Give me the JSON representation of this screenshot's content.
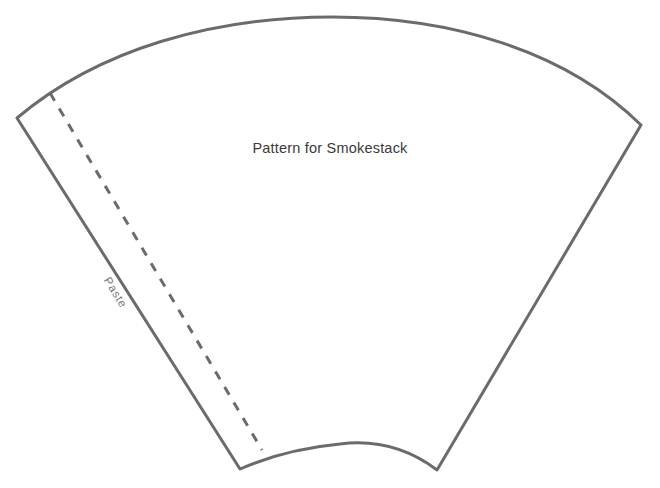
{
  "document": {
    "title": "Pattern for Smokestack",
    "background_color": "#ffffff",
    "width": 660,
    "height": 488
  },
  "labels": {
    "main": "Pattern for Smokestack",
    "paste_tab": "Paste"
  },
  "style": {
    "outline_color": "#6b6b6b",
    "outline_width": "3",
    "fold_line_color": "#6b6b6b",
    "fold_line_width": "3",
    "fold_dash_pattern": "9 9",
    "fill_color": "#ffffff",
    "main_text_color": "#3a3a3a",
    "paste_text_color": "#787878"
  },
  "geometry": {
    "type": "annular-sector",
    "description": "Fan-shaped cone development pattern with convex top arc, concave bottom arc, and a straight paste tab along the left edge",
    "corners": {
      "top_left": [
        17,
        118
      ],
      "top_right": [
        641,
        125
      ],
      "bottom_right": [
        437,
        470
      ],
      "bottom_left": [
        240,
        469
      ]
    },
    "top_arc": {
      "apex": [
        330,
        17
      ],
      "from": [
        17,
        118
      ],
      "to": [
        641,
        125
      ],
      "curve": "convex-up"
    },
    "bottom_arc": {
      "apex": [
        340,
        444
      ],
      "from": [
        240,
        469
      ],
      "to": [
        437,
        470
      ],
      "curve": "concave-up"
    },
    "fold_line": {
      "from": [
        50,
        93
      ],
      "to": [
        262,
        450
      ]
    }
  },
  "icons": {
    "fold_line": "dashed-fold-line",
    "pattern_outline": "cut-line"
  }
}
